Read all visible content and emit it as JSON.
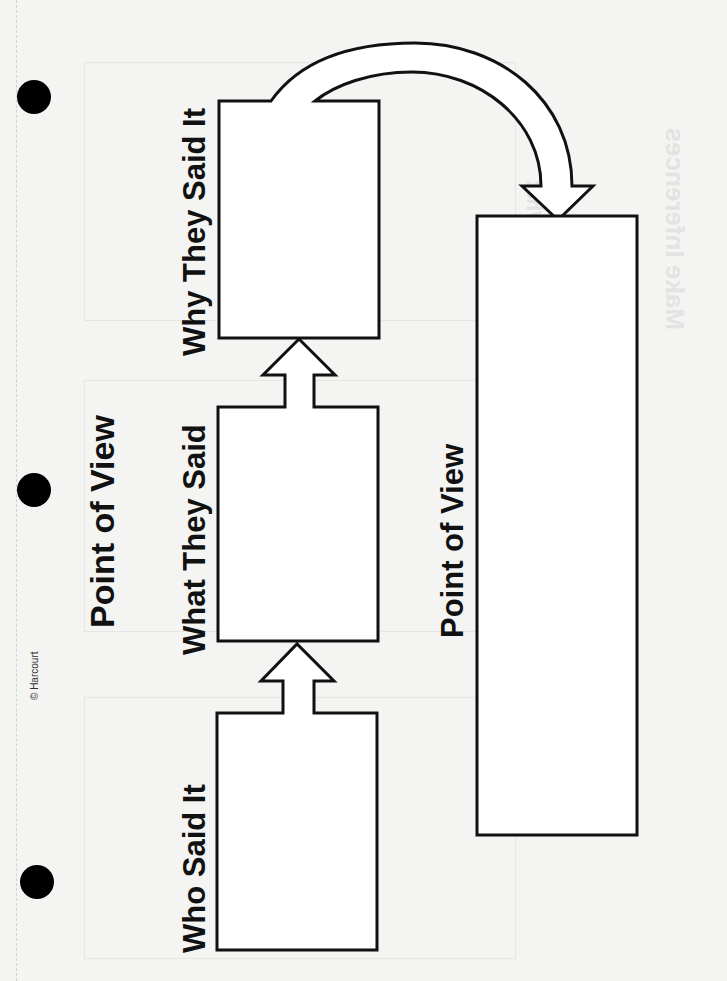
{
  "worksheet": {
    "title": "Point of View",
    "copyright": "© Harcourt",
    "boxes": [
      {
        "id": "who",
        "label": "Who Said It"
      },
      {
        "id": "what",
        "label": "What They Said"
      },
      {
        "id": "why",
        "label": "Why They Said It"
      },
      {
        "id": "pov",
        "label": "Point of View"
      }
    ],
    "flow": [
      "Who Said It",
      "What They Said",
      "Why They Said It",
      "Point of View"
    ],
    "show_through_text": [
      "Make Inferences",
      "Why Character Does",
      "Information from",
      "My Own Thought",
      "What"
    ]
  },
  "colors": {
    "paper": "#f4f4f3",
    "ink": "#111111",
    "hole": "#000000"
  }
}
